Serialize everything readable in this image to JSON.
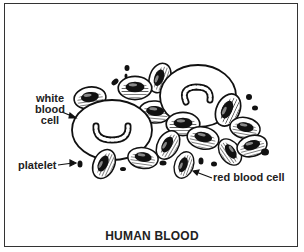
{
  "diagram": {
    "title": "HUMAN BLOOD",
    "labels": {
      "white_blood_cell": [
        "white",
        "blood",
        "cell"
      ],
      "platelet": "platelet",
      "red_blood_cell": "red blood cell"
    },
    "colors": {
      "ink": "#111111",
      "background": "#ffffff",
      "frame": "#333333"
    },
    "components": [
      {
        "name": "white blood cell",
        "count": 2,
        "description": "large pale oval cells with horseshoe-shaped nucleus"
      },
      {
        "name": "red blood cell",
        "count": 14,
        "description": "biconcave discs with hatched rim and dark center"
      },
      {
        "name": "platelet",
        "count": 10,
        "description": "small dark fragments"
      }
    ]
  }
}
